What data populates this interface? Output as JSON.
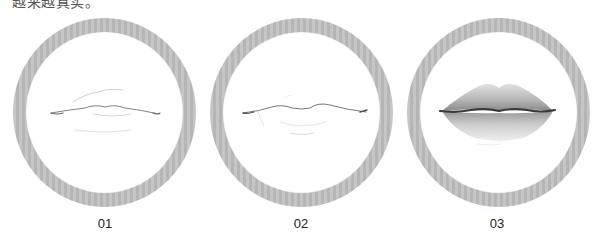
{
  "caption_top": "越来越真实。",
  "steps": [
    {
      "label": "01",
      "stage": "light-sketch-outline"
    },
    {
      "label": "02",
      "stage": "refined-sketch-outline"
    },
    {
      "label": "03",
      "stage": "shaded-rendered-lips"
    }
  ],
  "colors": {
    "ring": "#bdbdbd",
    "ring_inner": "#ffffff",
    "label_text": "#222222",
    "lip_line": "#3a3a3a"
  }
}
